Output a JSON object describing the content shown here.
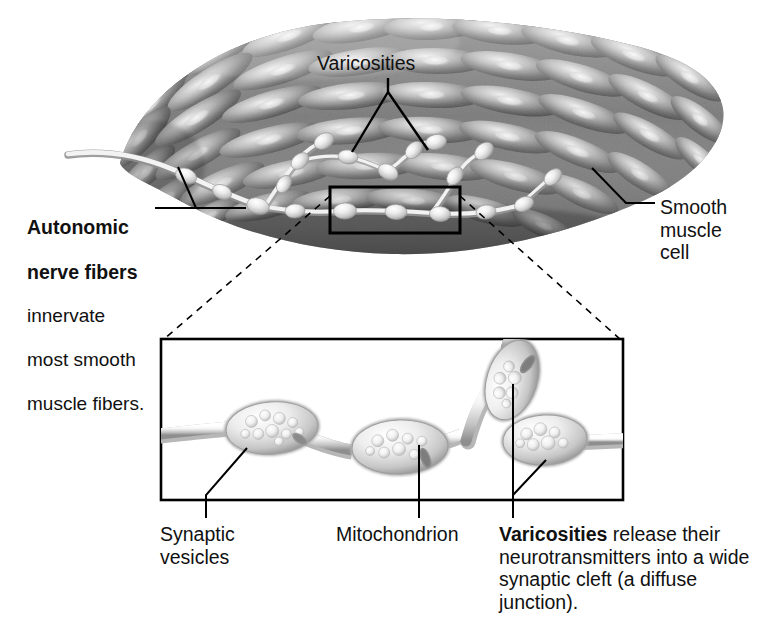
{
  "figure": {
    "background_color": "#ffffff",
    "line_color": "#000000",
    "style": "grayscale pencil rendering"
  },
  "labels": {
    "varicosities_top": "Varicosities",
    "smooth_muscle_cell": "Smooth\nmuscle\ncell",
    "autonomic_bold_line1": "Autonomic",
    "autonomic_bold_line2": "nerve fibers",
    "autonomic_rest_line1": "innervate",
    "autonomic_rest_line2": "most smooth",
    "autonomic_rest_line3": "muscle fibers.",
    "synaptic_vesicles": "Synaptic\nvesicles",
    "mitochondrion": "Mitochondrion",
    "varicosities_bold": "Varicosities",
    "varicosities_rest": " release their neurotransmitters into a wide synaptic cleft (a diffuse junction)."
  },
  "panels": {
    "overview": {
      "name": "smooth-muscle-sheet-overview",
      "description": "Curved band of spindle-shaped smooth muscle cells with branching autonomic nerve fibers bearing varicosities"
    },
    "callout_box": {
      "name": "magnification-callout-rectangle",
      "x": 330,
      "y": 187,
      "width": 130,
      "height": 46
    },
    "inset": {
      "name": "varicosity-detail-inset",
      "x": 161,
      "y": 339,
      "width": 462,
      "height": 161,
      "description": "Magnified nerve fiber with three varicosities containing synaptic vesicles and mitochondria, plus a branch varicosity above"
    }
  },
  "structures": {
    "varicosity": "varicosity",
    "synaptic_vesicle": "synaptic-vesicle",
    "mitochondrion": "mitochondrion",
    "nerve_fiber": "autonomic-nerve-fiber",
    "smooth_muscle_cell": "smooth-muscle-cell"
  },
  "colors": {
    "ink": "#000000",
    "paper": "#ffffff",
    "muscle_dark": "#4a4a4a",
    "muscle_mid": "#8a8a8a",
    "muscle_light": "#d8d8d8",
    "nerve_light": "#eeeeee",
    "nerve_shadow": "#9a9a9a"
  }
}
